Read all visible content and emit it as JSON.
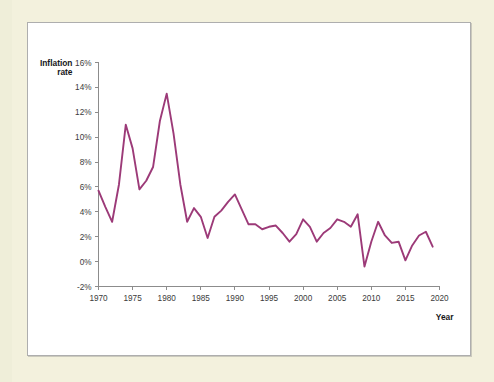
{
  "page": {
    "background_color": "#f3f1dd",
    "panel_background_color": "#ffffff",
    "panel_border_color": "#aeaeae"
  },
  "chart_data": {
    "type": "line",
    "title": "",
    "subtitle": "",
    "xlabel": "Year",
    "ylabel": "Inflation rate",
    "ylabel_line1": "Inflation",
    "ylabel_line2": "rate",
    "series_color": "#9c3a78",
    "grid": false,
    "legend": false,
    "legend_position": "none",
    "xlim": [
      1970,
      2020
    ],
    "ylim": [
      -2,
      16
    ],
    "x_tick_values": [
      1970,
      1975,
      1980,
      1985,
      1990,
      1995,
      2000,
      2005,
      2010,
      2015,
      2020
    ],
    "x_tick_labels": [
      "1970",
      "1975",
      "1980",
      "1985",
      "1990",
      "1995",
      "2000",
      "2005",
      "2010",
      "2015",
      "2020"
    ],
    "y_tick_values": [
      -2,
      0,
      2,
      4,
      6,
      8,
      10,
      12,
      14,
      16
    ],
    "y_tick_labels": [
      "-2%",
      "0%",
      "2%",
      "4%",
      "6%",
      "8%",
      "10%",
      "12%",
      "14%",
      "16%"
    ],
    "x": [
      1970,
      1971,
      1972,
      1973,
      1974,
      1975,
      1976,
      1977,
      1978,
      1979,
      1980,
      1981,
      1982,
      1983,
      1984,
      1985,
      1986,
      1987,
      1988,
      1989,
      1990,
      1991,
      1992,
      1993,
      1994,
      1995,
      1996,
      1997,
      1998,
      1999,
      2000,
      2001,
      2002,
      2003,
      2004,
      2005,
      2006,
      2007,
      2008,
      2009,
      2010,
      2011,
      2012,
      2013,
      2014,
      2015,
      2016,
      2017,
      2018,
      2019
    ],
    "values": [
      5.7,
      4.4,
      3.2,
      6.2,
      11.0,
      9.1,
      5.8,
      6.5,
      7.6,
      11.3,
      13.5,
      10.3,
      6.2,
      3.2,
      4.3,
      3.6,
      1.9,
      3.6,
      4.1,
      4.8,
      5.4,
      4.2,
      3.0,
      3.0,
      2.6,
      2.8,
      2.9,
      2.3,
      1.6,
      2.2,
      3.4,
      2.8,
      1.6,
      2.3,
      2.7,
      3.4,
      3.2,
      2.8,
      3.8,
      -0.4,
      1.6,
      3.2,
      2.1,
      1.5,
      1.6,
      0.1,
      1.3,
      2.1,
      2.4,
      1.2
    ],
    "series": [
      {
        "name": "Inflation rate",
        "color": "#9c3a78",
        "values": [
          5.7,
          4.4,
          3.2,
          6.2,
          11.0,
          9.1,
          5.8,
          6.5,
          7.6,
          11.3,
          13.5,
          10.3,
          6.2,
          3.2,
          4.3,
          3.6,
          1.9,
          3.6,
          4.1,
          4.8,
          5.4,
          4.2,
          3.0,
          3.0,
          2.6,
          2.8,
          2.9,
          2.3,
          1.6,
          2.2,
          3.4,
          2.8,
          1.6,
          2.3,
          2.7,
          3.4,
          3.2,
          2.8,
          3.8,
          -0.4,
          1.6,
          3.2,
          2.1,
          1.5,
          1.6,
          0.1,
          1.3,
          2.1,
          2.4,
          1.2
        ]
      }
    ],
    "annotations": []
  }
}
